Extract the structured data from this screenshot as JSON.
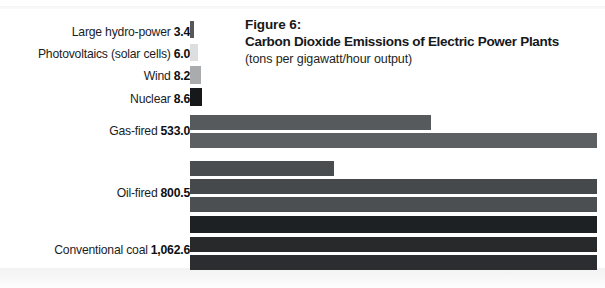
{
  "figure": {
    "number": "Figure 6:",
    "title": "Carbon Dioxide Emissions of Electric Power Plants",
    "subtitle": "(tons per gigawatt/hour output)"
  },
  "chart_data": {
    "type": "bar",
    "title": "Carbon Dioxide Emissions of Electric Power Plants",
    "subtitle": "(tons per gigawatt/hour output)",
    "xlabel": "",
    "ylabel": "",
    "orientation": "horizontal",
    "unit": "tons per gigawatt/hour output",
    "grid": false,
    "legend": false,
    "xlim": [
      0,
      1100
    ],
    "categories": [
      "Large hydro-power",
      "Photovoltaics (solar cells)",
      "Wind",
      "Nuclear",
      "Gas-fired",
      "Oil-fired",
      "Conventional coal"
    ],
    "values": [
      3.4,
      6.0,
      8.2,
      8.6,
      533.0,
      800.5,
      1062.6
    ],
    "value_labels": [
      "3.4",
      "6.0",
      "8.2",
      "8.6",
      "533.0",
      "800.5",
      "1,062.6"
    ],
    "rows": [
      {
        "category": "Large hydro-power",
        "value": 3.4,
        "value_label": "3.4",
        "label_y": 25,
        "bars": [
          {
            "y": 21,
            "height": 17,
            "width": 4,
            "color": "#55585b"
          }
        ]
      },
      {
        "category": "Photovoltaics (solar cells)",
        "value": 6.0,
        "value_label": "6.0",
        "label_y": 47,
        "bars": [
          {
            "y": 44,
            "height": 17,
            "width": 8,
            "color": "#dddedf"
          }
        ]
      },
      {
        "category": "Wind",
        "value": 8.2,
        "value_label": "8.2",
        "label_y": 69,
        "bars": [
          {
            "y": 66,
            "height": 18,
            "width": 11,
            "color": "#a9abad"
          }
        ]
      },
      {
        "category": "Nuclear",
        "value": 8.6,
        "value_label": "8.6",
        "label_y": 92,
        "bars": [
          {
            "y": 88,
            "height": 18,
            "width": 12,
            "color": "#16181a"
          }
        ]
      },
      {
        "category": "Gas-fired",
        "value": 533.0,
        "value_label": "533.0",
        "label_y": 124,
        "bars": [
          {
            "y": 115,
            "height": 15,
            "width": 241,
            "color": "#565a5d"
          },
          {
            "y": 133,
            "height": 15,
            "width": 407,
            "color": "#5c6063"
          }
        ]
      },
      {
        "category": "Oil-fired",
        "value": 800.5,
        "value_label": "800.5",
        "label_y": 186,
        "bars": [
          {
            "y": 161,
            "height": 15,
            "width": 144,
            "color": "#494d50"
          },
          {
            "y": 179,
            "height": 15,
            "width": 407,
            "color": "#46494c"
          },
          {
            "y": 197,
            "height": 15,
            "width": 407,
            "color": "#4b4f52"
          }
        ]
      },
      {
        "category": "Conventional coal",
        "value": 1062.6,
        "value_label": "1,062.6",
        "label_y": 243,
        "bars": [
          {
            "y": 216,
            "height": 17,
            "width": 407,
            "color": "#1e2123"
          },
          {
            "y": 237,
            "height": 15,
            "width": 407,
            "color": "#27292b"
          },
          {
            "y": 255,
            "height": 15,
            "width": 407,
            "color": "#2b2d30"
          }
        ]
      }
    ]
  }
}
